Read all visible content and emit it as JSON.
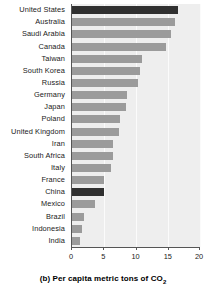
{
  "chart_data": {
    "type": "bar",
    "orientation": "horizontal",
    "title": "",
    "caption_prefix": "(b)",
    "caption_text": "Per capita metric tons of CO",
    "caption_subscript": "2",
    "xlabel": "",
    "ylabel": "",
    "xlim": [
      0,
      20
    ],
    "xticks": [
      0,
      5,
      10,
      15,
      20
    ],
    "xtick_labels": [
      "0",
      "5",
      "10",
      "15",
      "20"
    ],
    "grid": true,
    "legend": "none",
    "bar_color": "#9b9b9b",
    "highlight_color": "#303030",
    "plot_background": "#eeeeee",
    "highlighted_categories": [
      "United States",
      "China"
    ],
    "categories": [
      "United States",
      "Australia",
      "Saudi Arabia",
      "Canada",
      "Taiwan",
      "South Korea",
      "Russia",
      "Germany",
      "Japan",
      "Poland",
      "United Kingdom",
      "Iran",
      "South Africa",
      "Italy",
      "France",
      "China",
      "Mexico",
      "Brazil",
      "Indonesia",
      "India"
    ],
    "values": [
      16.4,
      16.0,
      15.3,
      14.6,
      10.8,
      10.6,
      10.3,
      8.6,
      8.4,
      7.4,
      7.3,
      6.3,
      6.3,
      6.1,
      5.0,
      4.9,
      3.6,
      1.8,
      1.6,
      1.3
    ]
  }
}
